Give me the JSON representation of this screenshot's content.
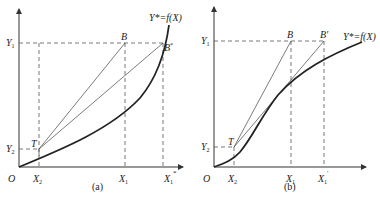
{
  "figure": {
    "panels": [
      {
        "id": "a",
        "caption": "(a)",
        "origin_label": "O",
        "curve_label": "Y* = f(X)",
        "y_ticks": [
          {
            "label": "Y1"
          },
          {
            "label": "Y2"
          }
        ],
        "x_ticks": [
          {
            "label": "X2"
          },
          {
            "label": "X1"
          },
          {
            "label": "X1*"
          }
        ],
        "points": [
          {
            "label": "B"
          },
          {
            "label": "B*"
          },
          {
            "label": "T"
          }
        ],
        "curve_shape": "convex"
      },
      {
        "id": "b",
        "caption": "(b)",
        "origin_label": "O",
        "curve_label": "Y* = f(X)",
        "y_ticks": [
          {
            "label": "Y1"
          },
          {
            "label": "Y2"
          }
        ],
        "x_ticks": [
          {
            "label": "X2"
          },
          {
            "label": "X1"
          },
          {
            "label": "X1'"
          }
        ],
        "points": [
          {
            "label": "B"
          },
          {
            "label": "B'"
          },
          {
            "label": "T"
          }
        ],
        "curve_shape": "concave"
      }
    ]
  },
  "labels": {
    "a": {
      "O": "O",
      "Y": "Y",
      "Y1sub": "1",
      "Y2sub": "2",
      "X": "X",
      "X1sub": "1",
      "X2sub": "2",
      "X1starsub": "1",
      "X1starsup": "*",
      "B": "B",
      "Bstar": "B",
      "Bstarsup": "*",
      "T": "T",
      "curve": "Y*=f(X)",
      "caption": "(a)"
    },
    "b": {
      "O": "O",
      "Y": "Y",
      "Y1sub": "1",
      "Y2sub": "2",
      "X": "X",
      "X1sub": "1",
      "X2sub": "2",
      "X1primesub": "1",
      "X1primesup": "′",
      "B": "B",
      "Bprime": "B′",
      "T": "T",
      "curve": "Y*=f(X)",
      "caption": "(b)"
    }
  }
}
